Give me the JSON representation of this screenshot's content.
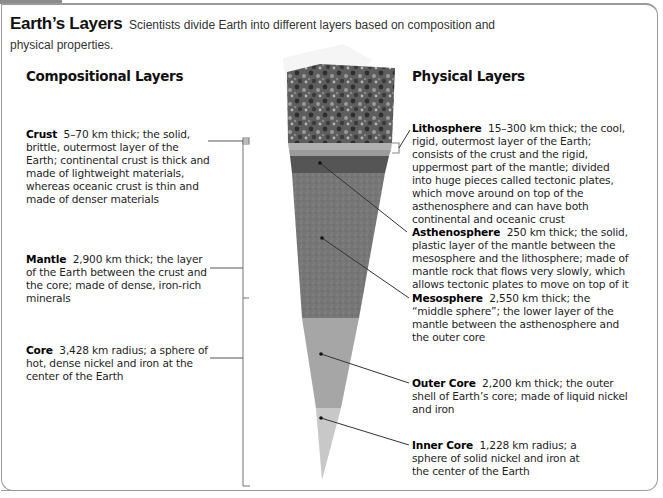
{
  "figure": {
    "title": "Earth’s Layers",
    "caption": "Scientists divide Earth into different layers based on composition and physical properties."
  },
  "compositional": {
    "heading": "Compositional Layers",
    "layers": [
      {
        "name": "Crust",
        "detail": "5–70 km thick; the solid, brittle, outermost layer of the Earth; continental crust is thick and made of lightweight materials, whereas oceanic crust is thin and made of denser materials"
      },
      {
        "name": "Mantle",
        "detail": "2,900 km thick; the layer of the Earth between the crust and the core; made of dense, iron-rich minerals"
      },
      {
        "name": "Core",
        "detail": "3,428 km radius; a sphere of hot, dense nickel and iron at the center of the Earth"
      }
    ]
  },
  "physical": {
    "heading": "Physical Layers",
    "layers": [
      {
        "name": "Lithosphere",
        "detail": "15–300 km thick; the cool, rigid, outermost layer of the Earth; consists of the crust and the rigid, uppermost part of the mantle; divided into huge pieces called tectonic plates, which move around on top of the asthenosphere and can have both continental and oceanic crust"
      },
      {
        "name": "Asthenosphere",
        "detail": "250 km thick; the solid, plastic layer of the mantle between the mesosphere and the lithosphere; made of mantle rock that flows very slowly, which allows tectonic plates to move on top of it"
      },
      {
        "name": "Mesosphere",
        "detail": "2,550 km thick; the “middle sphere”; the lower layer of the mantle between the asthenosphere and the outer core"
      },
      {
        "name": "Outer Core",
        "detail": "2,200 km thick; the outer shell of Earth’s core; made of liquid nickel and iron"
      },
      {
        "name": "Inner Core",
        "detail": "1,228 km radius; a sphere of solid nickel and iron at the center of the Earth"
      }
    ]
  },
  "colors": {
    "surface": "#6e6e6e",
    "crust_band": "#a8a8a8",
    "asthenosphere": "#595959",
    "mesosphere": "#7a7a7a",
    "outer_core": "#a9a9a9",
    "inner_core": "#c9c9c9",
    "frame": "#9a9a9a",
    "leader_line": "#333333"
  }
}
